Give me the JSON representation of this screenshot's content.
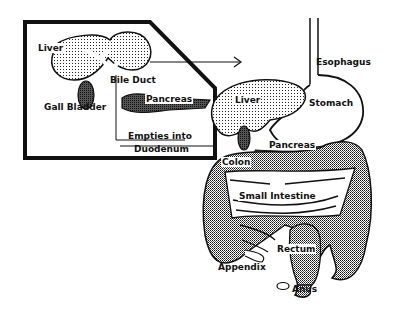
{
  "diagram": {
    "type": "anatomy",
    "colors": {
      "ink": "#111111",
      "background": "#ffffff",
      "stipple": "#bfbfbf"
    },
    "inset": {
      "labels": {
        "liver": "Liver",
        "gall_bladder": "Gall Bladder",
        "bile_duct": "Bile Duct",
        "pancreas": "Pancreas",
        "empties_line1": "Empties into",
        "empties_line2": "Duodenum"
      }
    },
    "main": {
      "labels": {
        "esophagus": "Esophagus",
        "liver": "Liver",
        "stomach": "Stomach",
        "pancreas": "Pancreas",
        "colon": "Colon",
        "small_intestine": "Small Intestine",
        "rectum": "Rectum",
        "appendix": "Appendix",
        "anus": "Anus"
      }
    }
  }
}
